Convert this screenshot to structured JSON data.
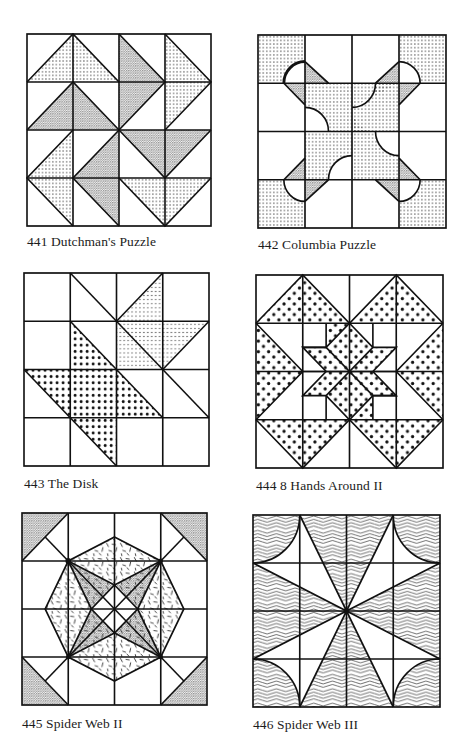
{
  "page": {
    "background": "#ffffff",
    "ink_color": "#1a1a1a"
  },
  "blocks": [
    {
      "number": "441",
      "name": "Dutchman's Puzzle",
      "caption": "441  Dutchman's Puzzle",
      "grid": "4x4"
    },
    {
      "number": "442",
      "name": "Columbia Puzzle",
      "caption": "442  Columbia Puzzle",
      "grid": "4x4"
    },
    {
      "number": "443",
      "name": "The Disk",
      "caption": "443  The Disk",
      "grid": "4x4"
    },
    {
      "number": "444",
      "name": "8 Hands Around II",
      "caption": "444  8 Hands Around II",
      "grid": "4x4"
    },
    {
      "number": "445",
      "name": "Spider Web II",
      "caption": "445  Spider Web II",
      "grid": "4x4"
    },
    {
      "number": "446",
      "name": "Spider Web III",
      "caption": "446  Spider Web III",
      "grid": "4x4"
    }
  ]
}
